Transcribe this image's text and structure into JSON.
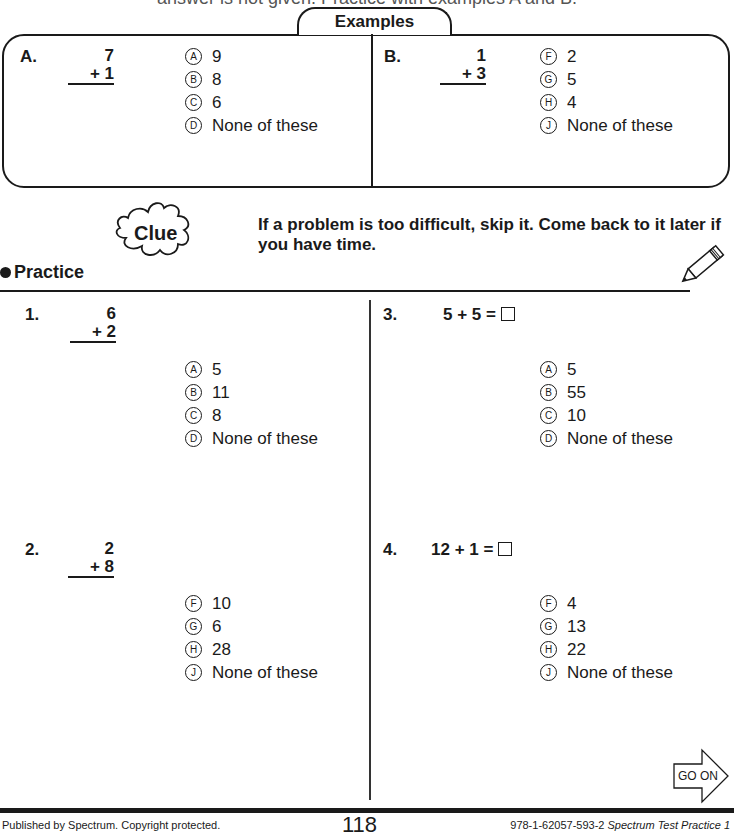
{
  "header": {
    "cut_text": "answer is not given. Practice with examples A and B."
  },
  "examples": {
    "title": "Examples",
    "items": [
      {
        "label": "A.",
        "top": "7",
        "bottom": "+ 1",
        "options": [
          {
            "letter": "A",
            "text": "9"
          },
          {
            "letter": "B",
            "text": "8"
          },
          {
            "letter": "C",
            "text": "6"
          },
          {
            "letter": "D",
            "text": "None of these"
          }
        ]
      },
      {
        "label": "B.",
        "top": "1",
        "bottom": "+ 3",
        "options": [
          {
            "letter": "F",
            "text": "2"
          },
          {
            "letter": "G",
            "text": "5"
          },
          {
            "letter": "H",
            "text": "4"
          },
          {
            "letter": "J",
            "text": "None of these"
          }
        ]
      }
    ]
  },
  "clue": {
    "icon_label": "Clue",
    "text_line1": "If a problem is too difficult, skip it. Come back to it later if",
    "text_line2": "you have time."
  },
  "practice": {
    "title": "Practice",
    "questions": [
      {
        "label": "1.",
        "type": "vertical",
        "top": "6",
        "bottom": "+ 2",
        "options": [
          {
            "letter": "A",
            "text": "5"
          },
          {
            "letter": "B",
            "text": "11"
          },
          {
            "letter": "C",
            "text": "8"
          },
          {
            "letter": "D",
            "text": "None of these"
          }
        ]
      },
      {
        "label": "2.",
        "type": "vertical",
        "top": "2",
        "bottom": "+ 8",
        "options": [
          {
            "letter": "F",
            "text": "10"
          },
          {
            "letter": "G",
            "text": "6"
          },
          {
            "letter": "H",
            "text": "28"
          },
          {
            "letter": "J",
            "text": "None of these"
          }
        ]
      },
      {
        "label": "3.",
        "type": "horizontal",
        "expression": "5 + 5 =",
        "options": [
          {
            "letter": "A",
            "text": "5"
          },
          {
            "letter": "B",
            "text": "55"
          },
          {
            "letter": "C",
            "text": "10"
          },
          {
            "letter": "D",
            "text": "None of these"
          }
        ]
      },
      {
        "label": "4.",
        "type": "horizontal",
        "expression": "12 + 1 =",
        "options": [
          {
            "letter": "F",
            "text": "4"
          },
          {
            "letter": "G",
            "text": "13"
          },
          {
            "letter": "H",
            "text": "22"
          },
          {
            "letter": "J",
            "text": "None of these"
          }
        ]
      }
    ]
  },
  "go_on": {
    "label": "GO ON"
  },
  "footer": {
    "left": "Published by Spectrum. Copyright protected.",
    "page_number": "118",
    "right_isbn": "978-1-62057-593-2",
    "right_title": "Spectrum Test Practice 1"
  }
}
